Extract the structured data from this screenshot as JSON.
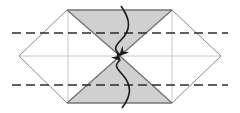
{
  "figure": {
    "caption": "",
    "width": 240,
    "height": 113,
    "background": "#ffffff"
  },
  "palette": {
    "paper_white": "#ffffff",
    "paper_shaded": "#d0d0d0",
    "shaded_stroke": "#5a5a5a",
    "outline_stroke": "#8a8a8a",
    "crease_light": "#c8c8c8",
    "fold_dashed": "#2b2b2b",
    "arrow_stroke": "#1a1a1a"
  },
  "geometry": {
    "hexagon_vertices": [
      {
        "name": "left-point",
        "x": 19,
        "y": 56
      },
      {
        "name": "top-left-peak",
        "x": 67,
        "y": 10
      },
      {
        "name": "top-right-peak",
        "x": 172,
        "y": 10
      },
      {
        "name": "right-point",
        "x": 221,
        "y": 56
      },
      {
        "name": "bottom-right-corner",
        "x": 172,
        "y": 103
      },
      {
        "name": "bottom-left-corner",
        "x": 67,
        "y": 103
      }
    ],
    "center_pinch": {
      "x": 120,
      "y": 56
    },
    "shaded_upper_triangle": "67,10 172,10 120,56",
    "shaded_lower_triangle": "67,103 172,103 120,56",
    "shaded_left_wing": "67,10 120,56 67,103",
    "shaded_right_wing": "172,10 120,56 172,103",
    "dashed_fold_lines": [
      {
        "name": "upper-fold-crease",
        "x1": 12,
        "y1": 33,
        "x2": 228,
        "y2": 33,
        "y_value": 33
      },
      {
        "name": "lower-fold-crease",
        "x1": 12,
        "y1": 85,
        "x2": 228,
        "y2": 85,
        "y_value": 85
      }
    ],
    "light_creases": [
      {
        "name": "horizontal-midline",
        "x1": 19,
        "y1": 56,
        "x2": 221,
        "y2": 56
      },
      {
        "name": "vertical-left-crease",
        "x1": 68,
        "y1": 10,
        "x2": 68,
        "y2": 103
      },
      {
        "name": "vertical-right-crease",
        "x1": 172,
        "y1": 10,
        "x2": 172,
        "y2": 103
      }
    ]
  },
  "annotations": {
    "arrows": [
      {
        "name": "fold-down-arrow",
        "direction": "down",
        "label": "",
        "path": "M 121 6 C 131 20, 131 30, 121 40 C 113 48, 115 50, 120 55",
        "tip": {
          "x": 120,
          "y": 55
        }
      },
      {
        "name": "fold-up-arrow",
        "direction": "up",
        "label": "",
        "path": "M 122 108 C 132 95, 132 85, 122 74 C 114 66, 116 64, 120 60",
        "tip": {
          "x": 120,
          "y": 60
        }
      }
    ]
  },
  "legend": {
    "items": [
      {
        "name": "valley-fold",
        "label": "",
        "style": "dashed"
      },
      {
        "name": "shaded-face",
        "label": "",
        "style": "filled"
      }
    ]
  }
}
